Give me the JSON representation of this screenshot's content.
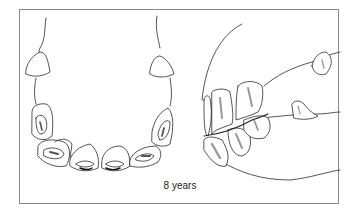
{
  "figure": {
    "caption": "8 years",
    "panels": [
      {
        "name": "occlusal-view",
        "description": "Lower incisor arcade viewed from above showing occlusal surfaces"
      },
      {
        "name": "lateral-view",
        "description": "Side view of incisors and canines"
      }
    ],
    "colors": {
      "line": "#2a2a2a",
      "shade": "#9a9a9a",
      "frame": "#8a8a8a",
      "background": "#ffffff"
    }
  }
}
